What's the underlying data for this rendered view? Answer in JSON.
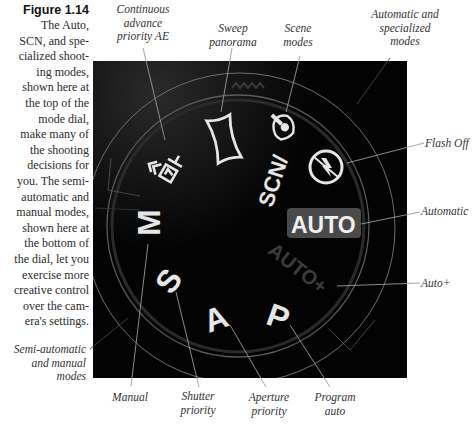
{
  "figure": {
    "number": "Figure 1.14",
    "caption_lines": [
      "The Auto,",
      "SCN, and spe-",
      "cialized shoot-",
      "ing modes,",
      "shown here at",
      "the top of the",
      "mode dial,",
      "make many of",
      "the shooting",
      "decisions for",
      "you. The semi-",
      "automatic and",
      "manual modes,",
      "shown here at",
      "the bottom of",
      "the dial, let you",
      "exercise more",
      "creative control",
      "over the cam-",
      "era's settings."
    ]
  },
  "dial": {
    "modes": {
      "scn": "SCN/",
      "auto": "AUTO",
      "auto_plus": "AUTO+",
      "m": "M",
      "s": "S",
      "a": "A",
      "p": "P"
    },
    "icons": [
      "continuous-advance-icon",
      "sweep-panorama-icon",
      "scene-portrait-icon",
      "flash-off-icon"
    ],
    "colors": {
      "background": "#030303",
      "label": "#e6e6e6",
      "auto_badge": "#4a4a4a",
      "auto_plus": "#3a3a3a",
      "ring": "#8a8a8a",
      "leader": "#9a9a9a"
    }
  },
  "callouts": {
    "continuous": [
      "Continuous",
      "advance",
      "priority AE"
    ],
    "sweep": [
      "Sweep",
      "panorama"
    ],
    "scene": [
      "Scene",
      "modes"
    ],
    "auto_specialized": [
      "Automatic and",
      "specialized",
      "modes"
    ],
    "flash_off": "Flash Off",
    "automatic": "Automatic",
    "auto_plus": "Auto+",
    "semi_auto": [
      "Semi-automatic",
      "and manual",
      "modes"
    ],
    "manual": "Manual",
    "shutter": [
      "Shutter",
      "priority"
    ],
    "aperture": [
      "Aperture",
      "priority"
    ],
    "program": [
      "Program",
      "auto"
    ]
  }
}
